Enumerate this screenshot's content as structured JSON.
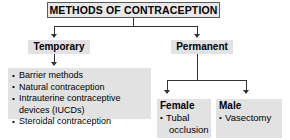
{
  "diagram": {
    "title": "METHODS OF CONTRACEPTION",
    "branches": {
      "temporary": {
        "label": "Temporary",
        "items": [
          {
            "text": "Barrier methods"
          },
          {
            "text": "Natural contraception"
          },
          {
            "text": "Intrauterine contraceptive",
            "cont": "devices (IUCDs)"
          },
          {
            "text": "Steroidal contraception"
          }
        ]
      },
      "permanent": {
        "label": "Permanent",
        "female": {
          "label": "Female",
          "items": [
            {
              "text": "Tubal",
              "cont": "occlusion"
            }
          ]
        },
        "male": {
          "label": "Male",
          "items": [
            {
              "text": "Vasectomy"
            }
          ]
        }
      }
    },
    "colors": {
      "node_fill": "#e2e2e2",
      "title_fill": "#e8e8e8",
      "title_border": "#5a5a5a",
      "connector": "#333333",
      "text": "#000000",
      "background": "#ffffff"
    }
  }
}
